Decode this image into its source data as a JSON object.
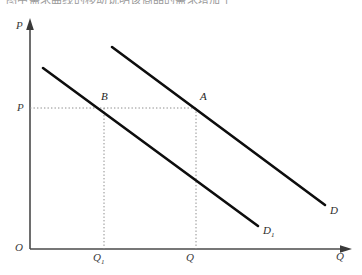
{
  "caption": {
    "text": "图中需求曲线的移动说明该商品的需求增加了"
  },
  "figure": {
    "axes": {
      "y_axis_label": "P",
      "x_axis_label": "Q",
      "origin_label": "O",
      "y_axis": {
        "x": 30,
        "top_y": 20,
        "bottom_y": 249
      },
      "x_axis": {
        "y": 249,
        "left_x": 30,
        "right_x": 352
      },
      "axis_color": "#4a4a4a",
      "axis_width": 1.6
    },
    "price_level": {
      "label": "P",
      "y": 108,
      "from_x": 30,
      "to_x": 196
    },
    "quantity_ticks": [
      {
        "label": "Q",
        "sub": "1",
        "x": 104,
        "label_x": 93,
        "label_y": 252
      },
      {
        "label": "Q",
        "sub": "",
        "x": 196,
        "label_x": 186,
        "label_y": 252
      }
    ],
    "curves": [
      {
        "name": "demand-curve-original",
        "label": "D",
        "sub": "1",
        "x1": 43,
        "y1": 68,
        "x2": 258,
        "y2": 226,
        "label_x": 263,
        "label_y": 225,
        "color": "#0d0d0d",
        "width": 2.6
      },
      {
        "name": "demand-curve-shifted",
        "label": "D",
        "sub": "",
        "x1": 112,
        "y1": 47,
        "x2": 325,
        "y2": 205,
        "label_x": 330,
        "label_y": 205,
        "color": "#0d0d0d",
        "width": 2.6
      }
    ],
    "points": [
      {
        "name": "point-B",
        "label": "B",
        "x": 104,
        "y": 108,
        "label_x": 101,
        "label_y": 91
      },
      {
        "name": "point-A",
        "label": "A",
        "x": 196,
        "y": 108,
        "label_x": 200,
        "label_y": 91
      }
    ],
    "guide_line_color": "#8c8c8c",
    "guide_line_style": "dotted"
  }
}
